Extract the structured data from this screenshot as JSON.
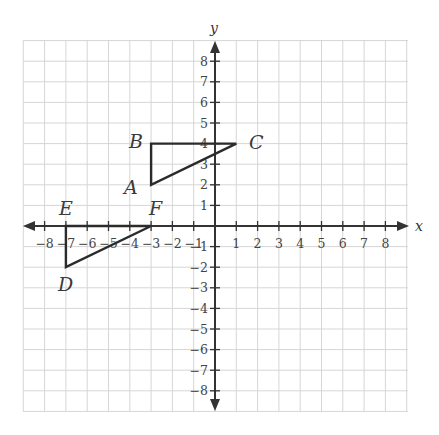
{
  "diagram": {
    "type": "coordinate-plane",
    "axes": {
      "x_label": "x",
      "y_label": "y",
      "x_range": [
        -8,
        8
      ],
      "y_range": [
        -8,
        8
      ],
      "x_ticks": [
        "-8",
        "-7",
        "-6",
        "-5",
        "-4",
        "-3",
        "-2",
        "-1",
        "1",
        "2",
        "3",
        "4",
        "5",
        "6",
        "7",
        "8"
      ],
      "y_ticks": [
        "8",
        "7",
        "6",
        "5",
        "4",
        "3",
        "2",
        "1",
        "-1",
        "-2",
        "-3",
        "-4",
        "-5",
        "-6",
        "-7",
        "-8"
      ],
      "grid": true
    },
    "colors": {
      "grid": "#d6d6d6",
      "axis": "#333333",
      "shape": "#2b2b2b"
    },
    "triangles": [
      {
        "name": "ABC",
        "vertices": [
          {
            "label": "A",
            "x": -3,
            "y": 2
          },
          {
            "label": "B",
            "x": -3,
            "y": 4
          },
          {
            "label": "C",
            "x": 1,
            "y": 4
          }
        ]
      },
      {
        "name": "DEF",
        "vertices": [
          {
            "label": "D",
            "x": -7,
            "y": -2
          },
          {
            "label": "E",
            "x": -7,
            "y": 0
          },
          {
            "label": "F",
            "x": -3,
            "y": 0
          }
        ]
      }
    ],
    "labels": {
      "A": "A",
      "B": "B",
      "C": "C",
      "D": "D",
      "E": "E",
      "F": "F"
    }
  }
}
